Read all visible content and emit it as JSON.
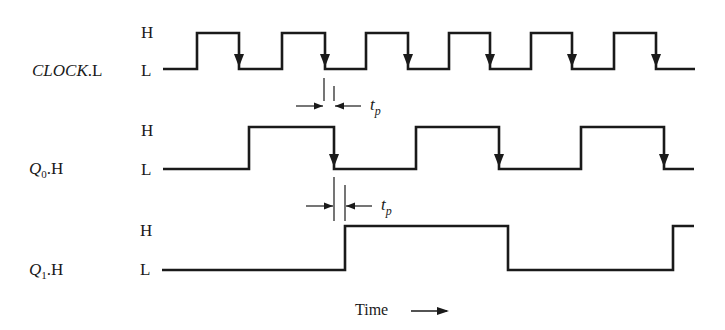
{
  "signals": [
    {
      "id": "clock",
      "name_main": "CLOCK",
      "name_sub": "",
      "name_suffix": ".L",
      "high_label": "H",
      "low_label": "L",
      "high_y": 33,
      "low_y": 69,
      "points": [
        [
          163,
          "L"
        ],
        [
          197,
          "H"
        ],
        [
          239,
          "L"
        ],
        [
          282,
          "H"
        ],
        [
          325,
          "L"
        ],
        [
          366,
          "H"
        ],
        [
          408,
          "L"
        ],
        [
          449,
          "H"
        ],
        [
          490,
          "L"
        ],
        [
          531,
          "H"
        ],
        [
          572,
          "L"
        ],
        [
          614,
          "H"
        ],
        [
          656,
          "L"
        ],
        [
          695,
          "L"
        ]
      ],
      "falling_edge_arrows": true
    },
    {
      "id": "q0",
      "name_main": "Q",
      "name_sub": "0",
      "name_suffix": ".H",
      "high_label": "H",
      "low_label": "L",
      "high_y": 127,
      "low_y": 169,
      "points": [
        [
          163,
          "L"
        ],
        [
          249,
          "H"
        ],
        [
          334,
          "L"
        ],
        [
          416,
          "H"
        ],
        [
          499,
          "L"
        ],
        [
          581,
          "H"
        ],
        [
          664,
          "L"
        ],
        [
          694,
          "L"
        ]
      ],
      "falling_edge_arrows": true
    },
    {
      "id": "q1",
      "name_main": "Q",
      "name_sub": "1",
      "name_suffix": ".H",
      "high_label": "H",
      "low_label": "L",
      "high_y": 226,
      "low_y": 270,
      "points": [
        [
          162,
          "L"
        ],
        [
          345,
          "H"
        ],
        [
          508,
          "L"
        ],
        [
          673,
          "H"
        ],
        [
          694,
          "H"
        ]
      ],
      "falling_edge_arrows": false
    }
  ],
  "annotations": [
    {
      "id": "tp-clock-q0",
      "label_main": "t",
      "label_sub": "p",
      "x1": 324,
      "x2": 334,
      "line_top": 78,
      "line_bottom": 101,
      "arrow_y": 106
    },
    {
      "id": "tp-q0-q1",
      "label_main": "t",
      "label_sub": "p",
      "x1": 334,
      "x2": 345,
      "line_top": 177,
      "line_bottom": 221,
      "arrow_y": 206
    }
  ],
  "axis": {
    "label": "Time",
    "arrow": "right-arrow"
  },
  "style": {
    "stroke": "#1a1a1a"
  }
}
